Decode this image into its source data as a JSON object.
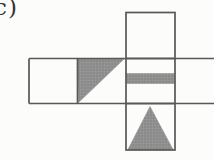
{
  "figure": {
    "label": "c)",
    "colors": {
      "background": "#fcfcfb",
      "line": "#585858",
      "shape_fill": "#929292",
      "shape_fill_dark": "#7b7b7b",
      "shape_fill_light": "#9d9d9d",
      "label_color": "#323232"
    },
    "net": {
      "squares": [
        {
          "name": "net-square-top",
          "x": 126,
          "y": 12.5,
          "w": 49,
          "h": 46
        },
        {
          "name": "net-square-bottom",
          "x": 126,
          "y": 103.5,
          "w": 49,
          "h": 46.5
        }
      ],
      "row": {
        "name": "net-row-outline",
        "x1": 29,
        "x2": 214,
        "y1": 58.5,
        "y2": 103.5,
        "dividers": [
          77.5,
          126,
          175
        ],
        "open_right": true
      },
      "gray_shapes": [
        {
          "name": "gray-right-triangle",
          "type": "polygon",
          "points": "77.5,58.5 124.5,58.5 78.5,102.5"
        },
        {
          "name": "gray-stripe",
          "type": "rect",
          "x": 126.5,
          "y": 73.5,
          "w": 48,
          "h": 10
        },
        {
          "name": "gray-up-triangle",
          "type": "polygon",
          "points": "150,106.5 128,149.5 173,149.5"
        }
      ]
    }
  }
}
